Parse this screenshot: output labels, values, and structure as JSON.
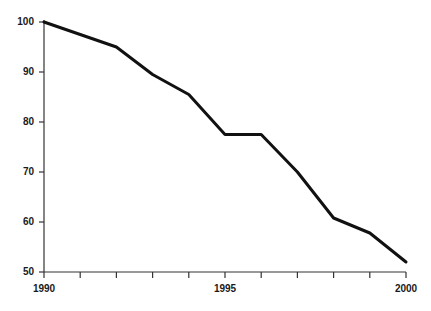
{
  "chart_data": {
    "type": "line",
    "title": "",
    "subtitle": "",
    "xlabel": "",
    "ylabel": "",
    "x": [
      1990,
      1991,
      1992,
      1993,
      1994,
      1995,
      1996,
      1997,
      1998,
      1999,
      2000
    ],
    "values": [
      100,
      97.5,
      95,
      89.5,
      85.5,
      77.5,
      77.5,
      70,
      60.8,
      57.8,
      52
    ],
    "series": [
      {
        "name": "index",
        "values": [
          100,
          97.5,
          95,
          89.5,
          85.5,
          77.5,
          77.5,
          70,
          60.8,
          57.8,
          52
        ]
      }
    ],
    "xlim": [
      1990,
      2000
    ],
    "ylim": [
      50,
      100
    ],
    "x_ticks": [
      1990,
      1991,
      1992,
      1993,
      1994,
      1995,
      1996,
      1997,
      1998,
      1999,
      2000
    ],
    "x_tick_labels": [
      "1990",
      "",
      "",
      "",
      "",
      "1995",
      "",
      "",
      "",
      "",
      "2000"
    ],
    "y_ticks": [
      50,
      60,
      70,
      80,
      90,
      100
    ],
    "y_tick_labels": [
      "50",
      "60",
      "70",
      "80",
      "90",
      "100"
    ],
    "grid": false,
    "legend": false,
    "legend_position": "none",
    "line_color": "#111111",
    "line_width": 3,
    "axis_color": "#333333",
    "background_color": "#ffffff",
    "annotations": []
  },
  "axis_labels": {
    "y": [
      {
        "value": 100,
        "label": "100"
      },
      {
        "value": 90,
        "label": "90"
      },
      {
        "value": 80,
        "label": "80"
      },
      {
        "value": 70,
        "label": "70"
      },
      {
        "value": 60,
        "label": "60"
      },
      {
        "value": 50,
        "label": "50"
      }
    ],
    "x": [
      {
        "value": 1990,
        "label": "1990"
      },
      {
        "value": 1995,
        "label": "1995"
      },
      {
        "value": 2000,
        "label": "2000"
      }
    ]
  }
}
